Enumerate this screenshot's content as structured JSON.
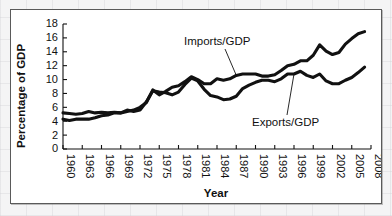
{
  "figure": {
    "background_color": "#ffffff",
    "page_background_color": "#f2f2f2",
    "border_color": "#5a5a5a",
    "line_color": "#111111"
  },
  "chart_data": {
    "type": "line",
    "title": "",
    "xlabel": "Year",
    "ylabel": "Percentage of GDP",
    "xlim": [
      1960,
      2008
    ],
    "ylim": [
      0,
      18
    ],
    "grid": false,
    "legend_position": "inline-annotations",
    "y_ticks": [
      0,
      2,
      4,
      6,
      8,
      10,
      12,
      14,
      16,
      18
    ],
    "y_tick_labels": [
      "0",
      "2",
      "4",
      "6",
      "8",
      "10",
      "12",
      "14",
      "16",
      "18"
    ],
    "x_ticks": [
      1960,
      1963,
      1966,
      1969,
      1972,
      1975,
      1978,
      1981,
      1984,
      1987,
      1990,
      1993,
      1996,
      1999,
      2002,
      2005,
      2008
    ],
    "x_tick_labels": [
      "1960",
      "1963",
      "1966",
      "1969",
      "1972",
      "1975",
      "1978",
      "1981",
      "1984",
      "1987",
      "1990",
      "1993",
      "1996",
      "1999",
      "2002",
      "2005",
      "2008"
    ],
    "x": [
      1960,
      1961,
      1962,
      1963,
      1964,
      1965,
      1966,
      1967,
      1968,
      1969,
      1970,
      1971,
      1972,
      1973,
      1974,
      1975,
      1976,
      1977,
      1978,
      1979,
      1980,
      1981,
      1982,
      1983,
      1984,
      1985,
      1986,
      1987,
      1988,
      1989,
      1990,
      1991,
      1992,
      1993,
      1994,
      1995,
      1996,
      1997,
      1998,
      1999,
      2000,
      2001,
      2002,
      2003,
      2004,
      2005,
      2006,
      2007
    ],
    "series": [
      {
        "name": "Imports/GDP",
        "label": "Imports/GDP",
        "values": [
          4.3,
          4.1,
          4.3,
          4.3,
          4.3,
          4.5,
          4.8,
          4.9,
          5.2,
          5.2,
          5.4,
          5.6,
          6.0,
          6.7,
          8.5,
          7.8,
          8.3,
          8.9,
          9.1,
          9.7,
          10.4,
          10.0,
          9.4,
          9.4,
          10.1,
          9.9,
          10.1,
          10.6,
          10.8,
          10.8,
          10.8,
          10.5,
          10.5,
          10.7,
          11.3,
          12.0,
          12.2,
          12.7,
          12.7,
          13.5,
          15.0,
          14.1,
          13.6,
          13.9,
          15.1,
          15.9,
          16.6,
          16.9
        ]
      },
      {
        "name": "Exports/GDP",
        "label": "Exports/GDP",
        "values": [
          5.2,
          5.1,
          5.0,
          5.1,
          5.4,
          5.2,
          5.3,
          5.2,
          5.3,
          5.2,
          5.6,
          5.4,
          5.6,
          6.8,
          8.4,
          8.2,
          8.1,
          7.8,
          8.2,
          9.3,
          10.2,
          9.8,
          8.6,
          7.7,
          7.5,
          7.1,
          7.2,
          7.6,
          8.7,
          9.2,
          9.6,
          9.9,
          9.9,
          9.7,
          10.1,
          10.8,
          10.8,
          11.2,
          10.6,
          10.3,
          10.8,
          9.8,
          9.4,
          9.4,
          9.9,
          10.3,
          11.0,
          11.8
        ]
      }
    ],
    "annotations": [
      {
        "text": "Imports/GDP",
        "target_year": 1987,
        "target_value": 10.6
      },
      {
        "text": "Exports/GDP",
        "target_year": 1996,
        "target_value": 10.8
      }
    ]
  }
}
